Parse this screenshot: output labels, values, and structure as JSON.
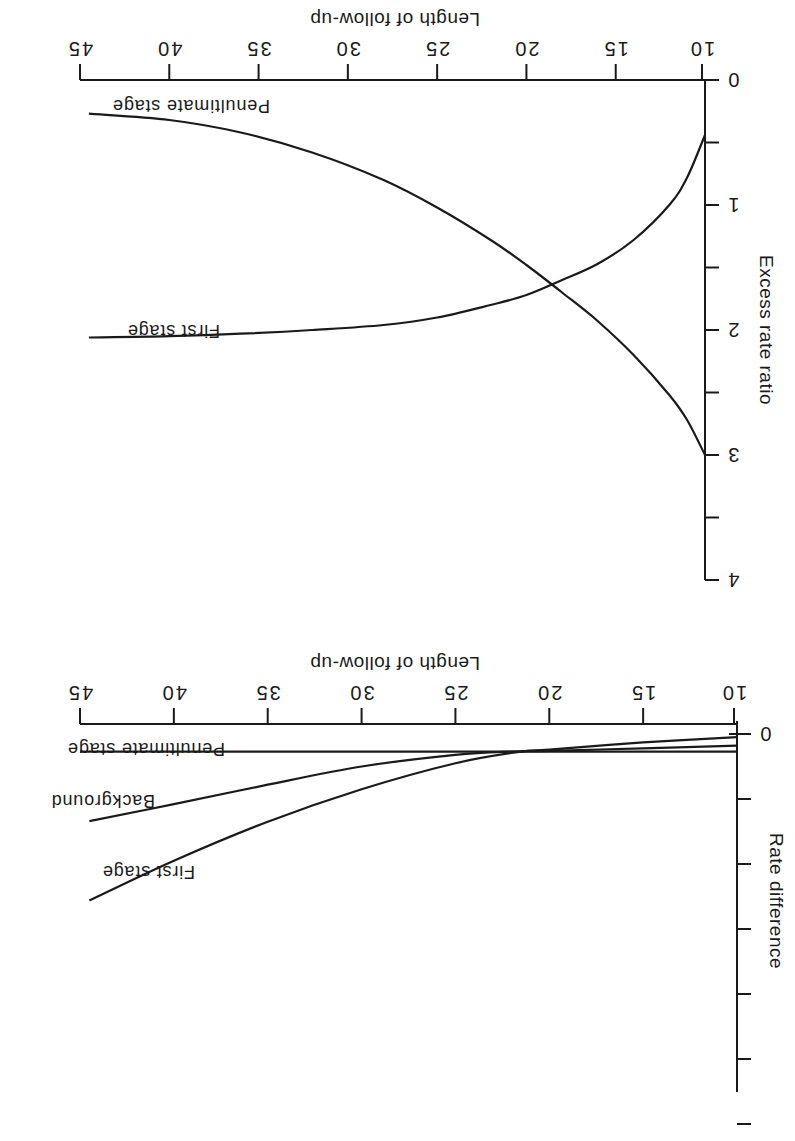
{
  "figure": {
    "orientation": "rotated-180",
    "line_color": "#1a1a1a",
    "background": "#ffffff"
  },
  "chart_data": [
    {
      "type": "line",
      "title": "",
      "xlabel": "Length of follow-up",
      "ylabel": "Excess rate ratio",
      "x_ticks": [
        10,
        15,
        20,
        25,
        30,
        35,
        40,
        45
      ],
      "y_ticks": [
        0,
        0.5,
        1,
        1.5,
        2,
        2.5,
        3,
        3.5,
        4
      ],
      "y_tick_labels": [
        "0",
        "1",
        "2",
        "3",
        "4"
      ],
      "xlim": [
        10,
        45
      ],
      "ylim": [
        0,
        4
      ],
      "grid": false,
      "series": [
        {
          "name": "Penultimate stage",
          "x": [
            10,
            11,
            12,
            14,
            16,
            18,
            20,
            22,
            25,
            28,
            32,
            36,
            40,
            44.5
          ],
          "values": [
            3.0,
            2.72,
            2.52,
            2.2,
            1.93,
            1.7,
            1.48,
            1.28,
            1.02,
            0.8,
            0.58,
            0.42,
            0.32,
            0.27
          ]
        },
        {
          "name": "First stage",
          "x": [
            10,
            11,
            12,
            14,
            16,
            18,
            20,
            22,
            25,
            28,
            32,
            36,
            40,
            44.5
          ],
          "values": [
            0.44,
            0.78,
            1.0,
            1.28,
            1.47,
            1.6,
            1.72,
            1.8,
            1.9,
            1.96,
            2.0,
            2.03,
            2.05,
            2.06
          ]
        }
      ],
      "annotations": [
        "Penultimate stage",
        "First stage"
      ]
    },
    {
      "type": "line",
      "title": "",
      "xlabel": "Length of follow-up",
      "ylabel": "Rate difference",
      "x_ticks": [
        10,
        15,
        20,
        25,
        30,
        35,
        40,
        45
      ],
      "y_tick_labels": [
        "0"
      ],
      "y_tick_count": 7,
      "xlim": [
        10,
        45
      ],
      "grid": false,
      "series": [
        {
          "name": "Penultimate stage",
          "x": [
            10,
            15,
            20,
            25,
            30,
            35,
            40,
            45
          ],
          "values": [
            0.27,
            0.27,
            0.27,
            0.27,
            0.27,
            0.27,
            0.27,
            0.27
          ]
        },
        {
          "name": "Background",
          "x": [
            10,
            15,
            20,
            22,
            25,
            30,
            35,
            40,
            44.5
          ],
          "values": [
            0.18,
            0.22,
            0.26,
            0.27,
            0.32,
            0.5,
            0.78,
            1.08,
            1.34
          ]
        },
        {
          "name": "First stage",
          "x": [
            10,
            15,
            20,
            21.5,
            25,
            30,
            35,
            40,
            44.5
          ],
          "values": [
            0.05,
            0.13,
            0.24,
            0.27,
            0.45,
            0.85,
            1.35,
            1.95,
            2.56
          ]
        }
      ],
      "annotations": [
        "Penultimate stage",
        "Background",
        "First stage"
      ]
    }
  ],
  "labels": {
    "top": {
      "xlabel": "Length of follow-up",
      "ylabel": "Excess rate ratio",
      "curve_penultimate": "Penultimate stage",
      "curve_first": "First stage",
      "x_tick_labels": [
        "10",
        "15",
        "20",
        "25",
        "30",
        "35",
        "40",
        "45"
      ],
      "y_tick_labels": [
        "0",
        "1",
        "2",
        "3",
        "4"
      ]
    },
    "bottom": {
      "xlabel": "Length of follow-up",
      "ylabel": "Rate difference",
      "curve_penultimate": "Penultimate stage",
      "curve_background": "Background",
      "curve_first": "First stage",
      "x_tick_labels": [
        "10",
        "15",
        "20",
        "25",
        "30",
        "35",
        "40",
        "45"
      ],
      "y_tick_labels": [
        "0"
      ]
    }
  }
}
